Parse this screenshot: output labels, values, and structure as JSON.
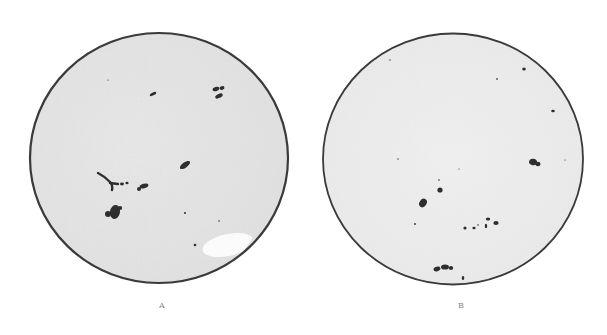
{
  "figure": {
    "colors": {
      "background": "#ffffff",
      "disc_fill": "#eeeeee",
      "disc_outline": "#3a3a3a",
      "spot": "#2e2e2e",
      "label": "#8a8a8a"
    },
    "panels": [
      {
        "label": "A",
        "label_pos": {
          "x": 162,
          "y": 304
        },
        "disc": {
          "cx": 159,
          "cy": 158,
          "rx": 129,
          "ry": 125,
          "stroke_width": 2.2
        },
        "highlight": {
          "cx": 228,
          "cy": 245,
          "rx": 26,
          "ry": 11
        },
        "spots": [
          {
            "type": "ellipse",
            "cx": 153,
            "cy": 94,
            "rx": 3.5,
            "ry": 1.5,
            "rot": -25
          },
          {
            "type": "ellipse",
            "cx": 216,
            "cy": 89,
            "rx": 3.5,
            "ry": 2,
            "rot": -20
          },
          {
            "type": "ellipse",
            "cx": 222,
            "cy": 88,
            "rx": 2.5,
            "ry": 1.8,
            "rot": -20
          },
          {
            "type": "ellipse",
            "cx": 219,
            "cy": 96,
            "rx": 4,
            "ry": 2,
            "rot": -25
          },
          {
            "type": "ellipse",
            "cx": 185,
            "cy": 165,
            "rx": 6,
            "ry": 2.6,
            "rot": -35
          },
          {
            "type": "ellipse",
            "cx": 115,
            "cy": 212,
            "rx": 5,
            "ry": 7,
            "rot": 10
          },
          {
            "type": "ellipse",
            "cx": 108,
            "cy": 214,
            "rx": 3,
            "ry": 3,
            "rot": 0
          },
          {
            "type": "ellipse",
            "cx": 120,
            "cy": 208,
            "rx": 2.2,
            "ry": 2,
            "rot": 0
          },
          {
            "type": "ellipse",
            "cx": 144,
            "cy": 186,
            "rx": 4.5,
            "ry": 2.2,
            "rot": -15
          },
          {
            "type": "ellipse",
            "cx": 139,
            "cy": 189,
            "rx": 2,
            "ry": 2,
            "rot": 0
          },
          {
            "type": "ellipse",
            "cx": 122,
            "cy": 184,
            "rx": 2,
            "ry": 1.4,
            "rot": 0
          },
          {
            "type": "ellipse",
            "cx": 127,
            "cy": 183,
            "rx": 1.6,
            "ry": 1.2,
            "rot": 0
          },
          {
            "type": "ellipse",
            "cx": 185,
            "cy": 213,
            "rx": 1,
            "ry": 1,
            "rot": 0
          },
          {
            "type": "ellipse",
            "cx": 195,
            "cy": 245,
            "rx": 1.3,
            "ry": 1.3,
            "rot": 0
          },
          {
            "type": "ellipse",
            "cx": 219,
            "cy": 221,
            "rx": 0.8,
            "ry": 0.8,
            "rot": 0
          },
          {
            "type": "ellipse",
            "cx": 108,
            "cy": 80,
            "rx": 0.6,
            "ry": 0.6,
            "rot": 0
          }
        ],
        "streaks": [
          {
            "d": "M98 173 Q104 176 110 182 Q113 185 112 190"
          },
          {
            "d": "M110 183 L118 184"
          }
        ]
      },
      {
        "label": "B",
        "label_pos": {
          "x": 461,
          "y": 304
        },
        "disc": {
          "cx": 453,
          "cy": 159,
          "rx": 130,
          "ry": 125.5,
          "stroke_width": 1.8
        },
        "highlight": null,
        "spots": [
          {
            "type": "ellipse",
            "cx": 524,
            "cy": 69,
            "rx": 1.8,
            "ry": 1.6,
            "rot": 0
          },
          {
            "type": "ellipse",
            "cx": 497,
            "cy": 79,
            "rx": 1,
            "ry": 0.8,
            "rot": 0
          },
          {
            "type": "ellipse",
            "cx": 553,
            "cy": 111,
            "rx": 1.8,
            "ry": 1.2,
            "rot": 0
          },
          {
            "type": "ellipse",
            "cx": 533,
            "cy": 162,
            "rx": 4,
            "ry": 3.2,
            "rot": 10
          },
          {
            "type": "ellipse",
            "cx": 538,
            "cy": 164,
            "rx": 2.5,
            "ry": 2.2,
            "rot": 0
          },
          {
            "type": "ellipse",
            "cx": 440,
            "cy": 190,
            "rx": 2.6,
            "ry": 2.6,
            "rot": 0
          },
          {
            "type": "ellipse",
            "cx": 439,
            "cy": 180,
            "rx": 0.8,
            "ry": 0.8,
            "rot": 0
          },
          {
            "type": "ellipse",
            "cx": 423,
            "cy": 203,
            "rx": 3.5,
            "ry": 4.5,
            "rot": 35
          },
          {
            "type": "ellipse",
            "cx": 415,
            "cy": 224,
            "rx": 0.9,
            "ry": 0.9,
            "rot": 0
          },
          {
            "type": "ellipse",
            "cx": 465,
            "cy": 228,
            "rx": 1.6,
            "ry": 1.6,
            "rot": 0
          },
          {
            "type": "ellipse",
            "cx": 474,
            "cy": 228,
            "rx": 1.6,
            "ry": 1.3,
            "rot": 0
          },
          {
            "type": "ellipse",
            "cx": 478,
            "cy": 225,
            "rx": 0.8,
            "ry": 0.8,
            "rot": 0
          },
          {
            "type": "ellipse",
            "cx": 488,
            "cy": 219,
            "rx": 2.2,
            "ry": 1.6,
            "rot": 0
          },
          {
            "type": "ellipse",
            "cx": 486,
            "cy": 226,
            "rx": 1.2,
            "ry": 2.2,
            "rot": 0
          },
          {
            "type": "ellipse",
            "cx": 496,
            "cy": 223,
            "rx": 2.6,
            "ry": 2,
            "rot": 0
          },
          {
            "type": "ellipse",
            "cx": 437,
            "cy": 269,
            "rx": 3.5,
            "ry": 2.2,
            "rot": -15
          },
          {
            "type": "ellipse",
            "cx": 445,
            "cy": 267,
            "rx": 4,
            "ry": 2.6,
            "rot": 0
          },
          {
            "type": "ellipse",
            "cx": 451,
            "cy": 268,
            "rx": 2.2,
            "ry": 2,
            "rot": 0
          },
          {
            "type": "ellipse",
            "cx": 463,
            "cy": 278,
            "rx": 1.3,
            "ry": 2,
            "rot": 0
          },
          {
            "type": "ellipse",
            "cx": 390,
            "cy": 60,
            "rx": 0.7,
            "ry": 0.7,
            "rot": 0
          },
          {
            "type": "ellipse",
            "cx": 398,
            "cy": 159,
            "rx": 0.7,
            "ry": 0.7,
            "rot": 0
          },
          {
            "type": "ellipse",
            "cx": 459,
            "cy": 169,
            "rx": 0.6,
            "ry": 0.6,
            "rot": 0
          },
          {
            "type": "ellipse",
            "cx": 565,
            "cy": 160,
            "rx": 0.6,
            "ry": 0.6,
            "rot": 0
          }
        ],
        "streaks": []
      }
    ]
  }
}
